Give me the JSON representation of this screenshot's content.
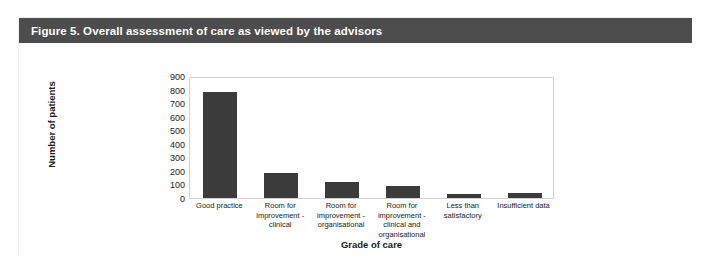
{
  "figure": {
    "header_title": "Figure 5. Overall assessment of care as viewed by the advisors",
    "header_color": "#4d4d4d",
    "bar_color": "#3b3b3b",
    "frame_color": "#d2d2d2"
  },
  "chart_data": {
    "type": "bar",
    "title": "Figure 5. Overall assessment of care as viewed by the advisors",
    "subtitle": "",
    "xlabel": "Grade of care",
    "ylabel": "Number of patients",
    "categories": [
      "Good practice",
      "Room for improvement - clinical",
      "Room for improvement - organisational",
      "Room for improvement - clinical and organisational",
      "Less than satisfactory",
      "Insufficient data"
    ],
    "values": [
      780,
      185,
      120,
      90,
      30,
      40
    ],
    "ylim": [
      0,
      900
    ],
    "yticks": [
      900,
      800,
      700,
      600,
      500,
      400,
      300,
      200,
      100,
      0
    ],
    "ytick_labels": [
      "900",
      "800",
      "700",
      "600",
      "500",
      "400",
      "300",
      "200",
      "100",
      "0"
    ],
    "grid": false,
    "legend": false,
    "legend_position": "none"
  }
}
